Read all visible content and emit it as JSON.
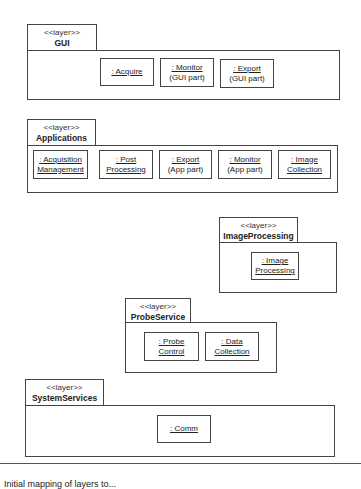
{
  "diagram": {
    "type": "uml-layered-package-diagram",
    "layers": [
      {
        "id": "gui",
        "stereotype": "<<layer>>",
        "name": "GUI",
        "parts": [
          {
            "line1": ": Acquire",
            "line2": ""
          },
          {
            "line1": ": Monitor",
            "line2": "(GUI part)"
          },
          {
            "line1": ": Export",
            "line2": "(GUI part)"
          }
        ]
      },
      {
        "id": "applications",
        "stereotype": "<<layer>>",
        "name": "Applications",
        "parts": [
          {
            "line1": ": Acquisition",
            "line2": "Management",
            "underline2": true
          },
          {
            "line1": ": Post",
            "line2": "Processing",
            "underline2": true
          },
          {
            "line1": ": Export",
            "line2": "(App part)"
          },
          {
            "line1": ": Monitor",
            "line2": "(App part)"
          },
          {
            "line1": ": Image",
            "line2": "Collection",
            "underline2": true
          }
        ]
      },
      {
        "id": "imageprocessing",
        "stereotype": "<<layer>>",
        "name": "ImageProcessing",
        "parts": [
          {
            "line1": ": Image",
            "line2": "Processing",
            "underline2": true
          }
        ]
      },
      {
        "id": "probeservice",
        "stereotype": "<<layer>>",
        "name": "ProbeService",
        "parts": [
          {
            "line1": ": Probe",
            "line2": "Control",
            "underline2": true
          },
          {
            "line1": ": Data",
            "line2": "Collection",
            "underline2": true
          }
        ]
      },
      {
        "id": "systemservices",
        "stereotype": "<<layer>>",
        "name": "SystemServices",
        "parts": [
          {
            "line1": ": Comm",
            "line2": ""
          }
        ]
      }
    ],
    "caption": "Initial mapping of layers to..."
  }
}
